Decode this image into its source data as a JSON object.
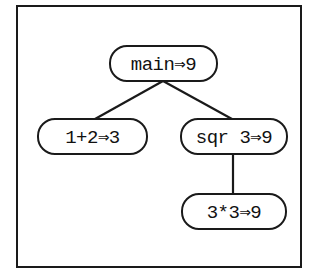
{
  "diagram": {
    "type": "evaluation-tree",
    "nodes": [
      {
        "id": "main",
        "label": "main⇒9"
      },
      {
        "id": "add",
        "label": "1+2⇒3"
      },
      {
        "id": "sqr",
        "label": "sqr 3⇒9"
      },
      {
        "id": "mul",
        "label": "3*3⇒9"
      }
    ],
    "edges": [
      {
        "from": "main",
        "to": "add"
      },
      {
        "from": "main",
        "to": "sqr"
      },
      {
        "from": "sqr",
        "to": "mul"
      }
    ],
    "colors": {
      "stroke": "#1a1a1a",
      "background": "#ffffff",
      "text": "#111111"
    }
  }
}
